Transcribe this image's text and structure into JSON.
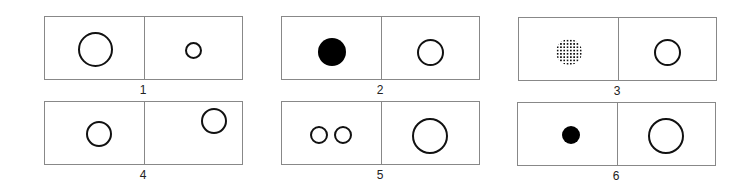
{
  "panels": [
    {
      "label": "1",
      "left_desc": "large outlined circle",
      "right_desc": "small outlined circle"
    },
    {
      "label": "2",
      "left_desc": "filled black circle",
      "right_desc": "outlined circle"
    },
    {
      "label": "3",
      "left_desc": "dotted-pattern circle",
      "right_desc": "outlined circle"
    },
    {
      "label": "4",
      "left_desc": "outlined circle lower-center",
      "right_desc": "outlined circle upper-right"
    },
    {
      "label": "5",
      "left_desc": "two small outlined circles",
      "right_desc": "large outlined circle"
    },
    {
      "label": "6",
      "left_desc": "small filled black circle",
      "right_desc": "large outlined circle"
    }
  ]
}
